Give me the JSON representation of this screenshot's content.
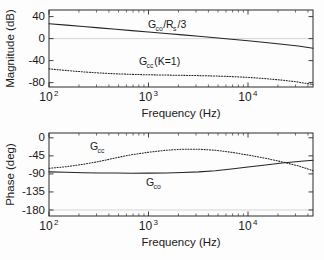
{
  "figure": {
    "title": "",
    "type": "bode-plot",
    "background_color": "#fdfdfd",
    "curve_color": "#242424"
  },
  "chart_data": [
    {
      "type": "line",
      "title": "",
      "subtitle": "",
      "panel": "magnitude",
      "xlabel": "Frequency (Hz)",
      "ylabel": "Magnitude (dB)",
      "xscale": "log",
      "xlim": [
        100,
        45000
      ],
      "ylim": [
        -88,
        52
      ],
      "grid": false,
      "legend_position": "inline-annotation",
      "xticks": [
        100,
        1000,
        10000
      ],
      "xticklabels": [
        "10^2",
        "10^3",
        "10^4"
      ],
      "xtick_bases": [
        "10",
        "10",
        "10"
      ],
      "xtick_exponents": [
        "2",
        "3",
        "4"
      ],
      "yticks": [
        40,
        0,
        -40,
        -80
      ],
      "yticklabels": [
        "40",
        "0",
        "-40",
        "-80"
      ],
      "reference_line_y": 0,
      "series": [
        {
          "name": "G_co/R_s/3",
          "style": "solid",
          "annotation": {
            "base": "G",
            "sub": "co",
            "tail": "/R",
            "tail_sub": "s",
            "tail2": "/3",
            "full": "G_co/R_s/3"
          },
          "x": [
            100,
            150,
            220,
            320,
            470,
            680,
            1000,
            1500,
            2200,
            3200,
            4700,
            6800,
            10000,
            15000,
            22000,
            32000,
            45000
          ],
          "y": [
            27,
            24.5,
            22,
            19.5,
            17,
            14.5,
            12,
            9.4,
            6.8,
            4.2,
            1.5,
            -1.2,
            -4.0,
            -7.0,
            -10.1,
            -13.5,
            -17.5
          ]
        },
        {
          "name": "G_cc(K=1)",
          "style": "dotted",
          "annotation": {
            "base": "G",
            "sub": "cc",
            "tail": "(K=1)",
            "full": "G_cc(K=1)"
          },
          "x": [
            100,
            150,
            220,
            320,
            470,
            680,
            1000,
            1500,
            2200,
            3200,
            4700,
            6800,
            10000,
            15000,
            22000,
            32000,
            45000
          ],
          "y": [
            -55,
            -58,
            -60.5,
            -62.5,
            -64,
            -65,
            -65.8,
            -66.3,
            -66.8,
            -67.3,
            -68,
            -69,
            -70.5,
            -72.8,
            -75.5,
            -79,
            -83.5
          ]
        }
      ]
    },
    {
      "type": "line",
      "title": "",
      "subtitle": "",
      "panel": "phase",
      "xlabel": "Frequency (Hz)",
      "ylabel": "Phase (deg)",
      "xscale": "log",
      "xlim": [
        100,
        45000
      ],
      "ylim": [
        -195,
        12
      ],
      "grid": false,
      "legend_position": "inline-annotation",
      "xticks": [
        100,
        1000,
        10000
      ],
      "xticklabels": [
        "10^2",
        "10^3",
        "10^4"
      ],
      "xtick_bases": [
        "10",
        "10",
        "10"
      ],
      "xtick_exponents": [
        "2",
        "3",
        "4"
      ],
      "yticks": [
        0,
        -45,
        -90,
        -135,
        -180
      ],
      "yticklabels": [
        "0",
        "-45",
        "-90",
        "-135",
        "-180"
      ],
      "reference_line_y": -180,
      "series": [
        {
          "name": "G_co",
          "style": "solid",
          "annotation": {
            "base": "G",
            "sub": "co",
            "full": "G_co"
          },
          "x": [
            100,
            150,
            220,
            320,
            470,
            680,
            1000,
            1500,
            2200,
            3200,
            4700,
            6800,
            10000,
            15000,
            22000,
            32000,
            45000
          ],
          "y": [
            -85,
            -86,
            -87,
            -87.6,
            -88,
            -88.2,
            -88,
            -87.5,
            -86.5,
            -85,
            -82,
            -78,
            -73,
            -68,
            -63,
            -59,
            -56
          ]
        },
        {
          "name": "G_cc",
          "style": "dotted",
          "annotation": {
            "base": "G",
            "sub": "cc",
            "full": "G_cc"
          },
          "x": [
            100,
            150,
            220,
            320,
            470,
            680,
            1000,
            1500,
            2200,
            3200,
            4700,
            6800,
            10000,
            15000,
            22000,
            32000,
            45000
          ],
          "y": [
            -76,
            -72,
            -66,
            -59,
            -50,
            -42,
            -36,
            -31,
            -28.5,
            -28.5,
            -31,
            -36,
            -43,
            -51,
            -60,
            -70,
            -82
          ]
        }
      ]
    }
  ]
}
